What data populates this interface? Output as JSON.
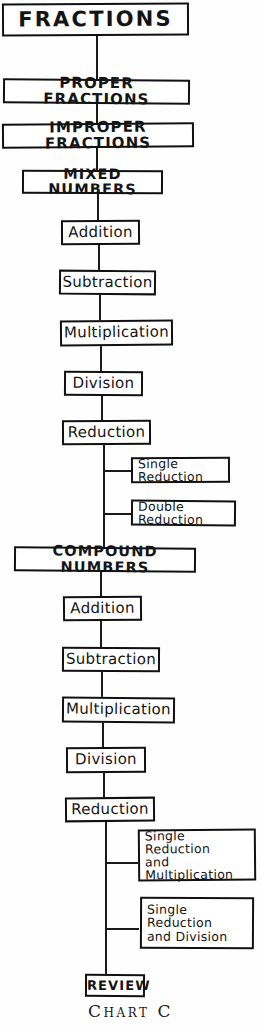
{
  "chart": {
    "caption": "Chart C",
    "title_node": {
      "label": "FRACTIONS"
    },
    "spine": [
      {
        "label": "PROPER FRACTIONS"
      },
      {
        "label": "IMPROPER FRACTIONS"
      },
      {
        "label": "MIXED NUMBERS"
      },
      {
        "label": "Addition"
      },
      {
        "label": "Subtraction"
      },
      {
        "label": "Multiplication"
      },
      {
        "label": "Division"
      },
      {
        "label": "Reduction"
      },
      {
        "label": "COMPOUND NUMBERS"
      },
      {
        "label": "Addition"
      },
      {
        "label": "Subtraction"
      },
      {
        "label": "Multiplication"
      },
      {
        "label": "Division"
      },
      {
        "label": "Reduction"
      },
      {
        "label": "REVIEW"
      }
    ],
    "branches": [
      {
        "label": "Single Reduction"
      },
      {
        "label": "Double Reduction"
      },
      {
        "label": "Single Reduction\nand Multiplication"
      },
      {
        "label": "Single Reduction\nand Division"
      }
    ],
    "colors": {
      "ink": "#111111",
      "paper": "#fefefe"
    }
  }
}
